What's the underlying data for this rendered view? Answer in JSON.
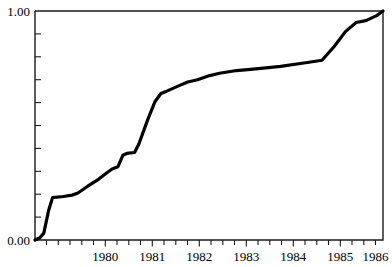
{
  "chart_data": {
    "type": "line",
    "title": "",
    "subtitle": "",
    "xlabel": "",
    "ylabel": "",
    "xlim": [
      1979.42,
      1986.55
    ],
    "ylim": [
      0.0,
      1.0
    ],
    "grid": false,
    "legend": null,
    "y_tick_labels": [
      "0.00",
      "1.00"
    ],
    "y_tick_values": [
      0.0,
      1.0
    ],
    "y_minor_tick_count": 9,
    "x_tick_labels": [
      "1980",
      "1981",
      "1982",
      "1983",
      "1984",
      "1985",
      "1986"
    ],
    "x_tick_values": [
      1980,
      1981,
      1982,
      1983,
      1984,
      1985,
      1986
    ],
    "x_minor_ticks_per_year": 4,
    "line_color": "#000000",
    "frame_color": "#1a1a1a",
    "background_color": "#ffffff",
    "series": [
      {
        "name": "cumulative proportion",
        "x": [
          1979.42,
          1979.52,
          1979.6,
          1979.7,
          1979.78,
          1980.0,
          1980.18,
          1980.3,
          1980.5,
          1980.72,
          1980.9,
          1981.0,
          1981.12,
          1981.22,
          1981.3,
          1981.46,
          1981.55,
          1981.72,
          1981.88,
          1982.0,
          1982.12,
          1982.35,
          1982.55,
          1982.75,
          1983.0,
          1983.2,
          1983.55,
          1984.0,
          1984.45,
          1985.0,
          1985.3,
          1985.55,
          1985.78,
          1986.0,
          1986.2,
          1986.42,
          1986.55
        ],
        "y": [
          0.0,
          0.01,
          0.03,
          0.13,
          0.185,
          0.19,
          0.196,
          0.205,
          0.235,
          0.265,
          0.295,
          0.31,
          0.32,
          0.37,
          0.378,
          0.382,
          0.42,
          0.52,
          0.605,
          0.64,
          0.65,
          0.672,
          0.69,
          0.7,
          0.718,
          0.728,
          0.74,
          0.748,
          0.758,
          0.775,
          0.785,
          0.845,
          0.91,
          0.95,
          0.958,
          0.98,
          1.0
        ]
      }
    ]
  },
  "axes": {
    "y_top_label": "1.00",
    "y_bottom_label": "0.00",
    "x_labels": [
      "1980",
      "1981",
      "1982",
      "1983",
      "1984",
      "1985",
      "1986"
    ]
  }
}
